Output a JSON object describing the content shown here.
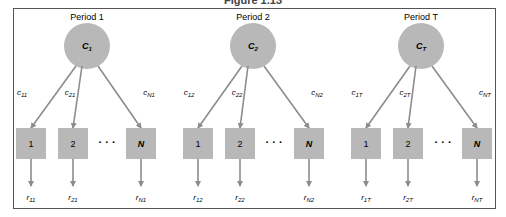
{
  "figure": {
    "title": "Figure 1.13",
    "colors": {
      "node_fill": "#b8b8b8",
      "edge": "#8c8c8c",
      "frame": "#555555"
    },
    "periods": [
      {
        "label": "Period 1",
        "node": "C",
        "node_sub": "1",
        "edges": [
          {
            "c": "c",
            "sub": "11"
          },
          {
            "c": "c",
            "sub": "21"
          },
          {
            "c": "c",
            "sub": "N1"
          }
        ],
        "boxes": [
          "1",
          "2",
          "N"
        ],
        "ellipsis": "· · ·",
        "returns": [
          {
            "r": "r",
            "sub": "11"
          },
          {
            "r": "r",
            "sub": "21"
          },
          {
            "r": "r",
            "sub": "N1"
          }
        ]
      },
      {
        "label": "Period 2",
        "node": "C",
        "node_sub": "2",
        "edges": [
          {
            "c": "c",
            "sub": "12"
          },
          {
            "c": "c",
            "sub": "22"
          },
          {
            "c": "c",
            "sub": "N2"
          }
        ],
        "boxes": [
          "1",
          "2",
          "N"
        ],
        "ellipsis": "· · ·",
        "returns": [
          {
            "r": "r",
            "sub": "12"
          },
          {
            "r": "r",
            "sub": "22"
          },
          {
            "r": "r",
            "sub": "N2"
          }
        ]
      },
      {
        "label": "Period T",
        "node": "C",
        "node_sub": "T",
        "edges": [
          {
            "c": "c",
            "sub": "1T"
          },
          {
            "c": "c",
            "sub": "2T"
          },
          {
            "c": "c",
            "sub": "NT"
          }
        ],
        "boxes": [
          "1",
          "2",
          "N"
        ],
        "ellipsis": "· · ·",
        "returns": [
          {
            "r": "r",
            "sub": "1T"
          },
          {
            "r": "r",
            "sub": "2T"
          },
          {
            "r": "r",
            "sub": "NT"
          }
        ]
      }
    ]
  }
}
